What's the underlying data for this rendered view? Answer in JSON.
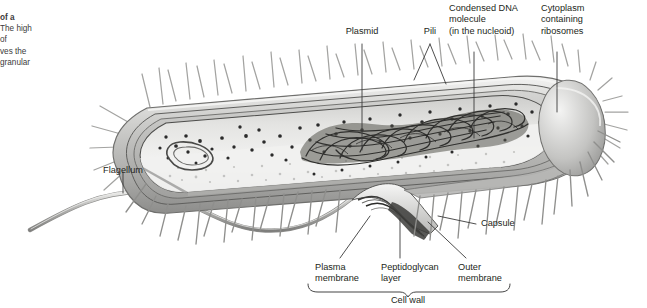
{
  "figure": {
    "kind": "biology-diagram",
    "background": "#ffffff",
    "ink": "#231f20"
  },
  "caption": {
    "lines": [
      "of a",
      "The high",
      "of",
      "ves the",
      "granular"
    ],
    "bold_first_line": true,
    "note": "text clipped at left page edge"
  },
  "labels": {
    "plasmid": "Plasmid",
    "pili": "Pili",
    "condensed_dna": "Condensed DNA\nmolecule\n(in the nucleoid)",
    "cytoplasm": "Cytoplasm\ncontaining\nribosomes",
    "flagellum": "Flagellum",
    "capsule": "Capsule",
    "plasma_membrane": "Plasma\nmembrane",
    "peptidoglycan": "Peptidoglycan\nlayer",
    "outer_membrane": "Outer\nmembrane",
    "cell_wall": "Cell wall"
  },
  "colors": {
    "leader": "#3a3a3a",
    "envelope_light": "#d8d8d6",
    "envelope_mid": "#b4b4b2",
    "envelope_dark": "#8a8a88",
    "cytoplasm_fill": "#eeeeec",
    "cytoplasm_band": "#cfcfcd",
    "ribosome": "#2e2e2e",
    "dna": "#3b3b3b",
    "pili": "#9d9d9b",
    "flagellum": "#a8a8a6",
    "plasmid": "#5a5a58"
  }
}
